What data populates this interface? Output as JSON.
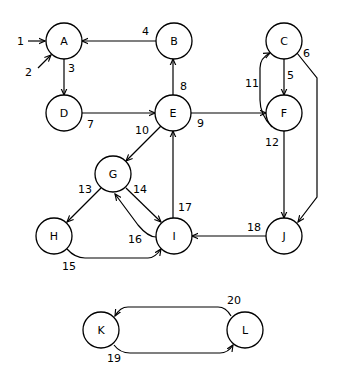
{
  "diagram": {
    "type": "directed-graph",
    "nodes": [
      {
        "id": "A",
        "label": "A",
        "x": 64,
        "y": 41
      },
      {
        "id": "B",
        "label": "B",
        "x": 174,
        "y": 41
      },
      {
        "id": "C",
        "label": "C",
        "x": 284,
        "y": 41
      },
      {
        "id": "D",
        "label": "D",
        "x": 64,
        "y": 113
      },
      {
        "id": "E",
        "label": "E",
        "x": 173,
        "y": 113
      },
      {
        "id": "F",
        "label": "F",
        "x": 284,
        "y": 113
      },
      {
        "id": "G",
        "label": "G",
        "x": 113,
        "y": 174
      },
      {
        "id": "H",
        "label": "H",
        "x": 54,
        "y": 236
      },
      {
        "id": "I",
        "label": "I",
        "x": 174,
        "y": 236
      },
      {
        "id": "J",
        "label": "J",
        "x": 284,
        "y": 236
      },
      {
        "id": "K",
        "label": "K",
        "x": 101,
        "y": 332
      },
      {
        "id": "L",
        "label": "L",
        "x": 245,
        "y": 330
      }
    ],
    "edges": [
      {
        "id": 1,
        "label": "1",
        "from": null,
        "to": "A"
      },
      {
        "id": 2,
        "label": "2",
        "from": null,
        "to": "A"
      },
      {
        "id": 3,
        "label": "3",
        "from": "A",
        "to": "D"
      },
      {
        "id": 4,
        "label": "4",
        "from": "B",
        "to": "A"
      },
      {
        "id": 5,
        "label": "5",
        "from": "C",
        "to": "F"
      },
      {
        "id": 6,
        "label": "6",
        "from": "C",
        "to": "J"
      },
      {
        "id": 7,
        "label": "7",
        "from": "D",
        "to": "E"
      },
      {
        "id": 8,
        "label": "8",
        "from": "E",
        "to": "B"
      },
      {
        "id": 9,
        "label": "9",
        "from": "E",
        "to": "F"
      },
      {
        "id": 10,
        "label": "10",
        "from": "E",
        "to": "G"
      },
      {
        "id": 11,
        "label": "11",
        "from": "F",
        "to": "C"
      },
      {
        "id": 12,
        "label": "12",
        "from": "F",
        "to": "J"
      },
      {
        "id": 13,
        "label": "13",
        "from": "G",
        "to": "H"
      },
      {
        "id": 14,
        "label": "14",
        "from": "G",
        "to": "I"
      },
      {
        "id": 15,
        "label": "15",
        "from": "H",
        "to": "I"
      },
      {
        "id": 16,
        "label": "16",
        "from": "I",
        "to": "G"
      },
      {
        "id": 17,
        "label": "17",
        "from": "I",
        "to": "E"
      },
      {
        "id": 18,
        "label": "18",
        "from": "J",
        "to": "I"
      },
      {
        "id": 19,
        "label": "19",
        "from": "K",
        "to": "L"
      },
      {
        "id": 20,
        "label": "20",
        "from": "L",
        "to": "K"
      }
    ]
  }
}
